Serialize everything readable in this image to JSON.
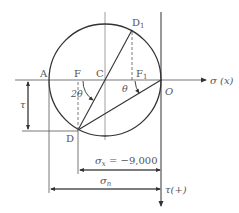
{
  "diagram": {
    "type": "mohr-circle",
    "colors": {
      "stroke": "#333333",
      "axis": "#777777",
      "text": "#555555",
      "background": "#ffffff"
    },
    "points": {
      "A": "A",
      "F": "F",
      "C": "C",
      "D1": "D",
      "D1_sub": "1",
      "F1": "F",
      "F1_sub": "1",
      "O": "O",
      "D": "D"
    },
    "angles": {
      "two_theta": "2θ",
      "theta": "θ"
    },
    "axes": {
      "sigma_axis_label": "σ (x)",
      "tau_axis_label": "τ(+)"
    },
    "dimensions": {
      "tau": "τ",
      "sigma_x_symbol": "σ",
      "sigma_x_sub": "x",
      "sigma_x_value": " = −9,000",
      "sigma_n_symbol": "σ",
      "sigma_n_sub": "n"
    }
  }
}
